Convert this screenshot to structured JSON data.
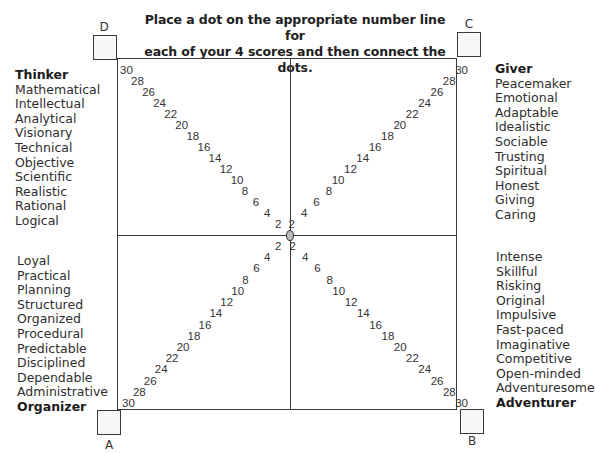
{
  "instructions": {
    "line1": "Place a dot on the appropriate number line for",
    "line2": "each of your 4 scores and then connect the dots."
  },
  "corners": {
    "A": "A",
    "B": "B",
    "C": "C",
    "D": "D"
  },
  "scale_numbers": [
    "2",
    "4",
    "6",
    "8",
    "10",
    "12",
    "14",
    "16",
    "18",
    "20",
    "22",
    "24",
    "26",
    "28",
    "30"
  ],
  "center_label": "0",
  "quadrants": {
    "thinker": {
      "title": "Thinker",
      "corner": "D",
      "words": [
        "Mathematical",
        "Intellectual",
        "Analytical",
        "Visionary",
        "Technical",
        "Objective",
        "Scientific",
        "Realistic",
        "Rational",
        "Logical"
      ]
    },
    "giver": {
      "title": "Giver",
      "corner": "C",
      "words": [
        "Peacemaker",
        "Emotional",
        "Adaptable",
        "Idealistic",
        "Sociable",
        "Trusting",
        "Spiritual",
        "Honest",
        "Giving",
        "Caring"
      ]
    },
    "organizer": {
      "title": "Organizer",
      "corner": "A",
      "words": [
        "Loyal",
        "Practical",
        "Planning",
        "Structured",
        "Organized",
        "Procedural",
        "Predictable",
        "Disciplined",
        "Dependable",
        "Administrative"
      ]
    },
    "adventurer": {
      "title": "Adventurer",
      "corner": "B",
      "words": [
        "Intense",
        "Skillful",
        "Risking",
        "Original",
        "Impulsive",
        "Fast-paced",
        "Imaginative",
        "Competitive",
        "Open-minded",
        "Adventuresome"
      ]
    }
  },
  "colors": {
    "line": "#3a3a3a",
    "text": "#2e2e2e",
    "box_fill": "#f7f7f7"
  }
}
